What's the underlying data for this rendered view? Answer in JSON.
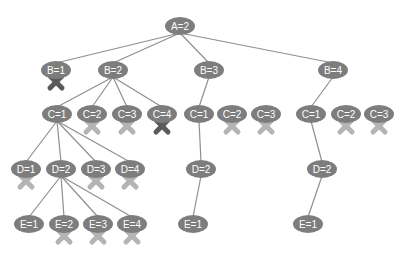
{
  "diagram": {
    "type": "search-tree",
    "colors": {
      "node_fill": "#7d7d7d",
      "edge": "#8f8f8f",
      "prune_dark": "#5a5a5a",
      "prune_light": "#b4b4b4",
      "background": "#ffffff"
    },
    "nodes": [
      {
        "id": "a2",
        "label": "A=2",
        "x": 180,
        "y": 26,
        "prune": null
      },
      {
        "id": "b1",
        "label": "B=1",
        "x": 56,
        "y": 70,
        "prune": "dark"
      },
      {
        "id": "b2",
        "label": "B=2",
        "x": 113,
        "y": 70,
        "prune": null
      },
      {
        "id": "b3",
        "label": "B=3",
        "x": 209,
        "y": 70,
        "prune": null
      },
      {
        "id": "b4",
        "label": "B=4",
        "x": 333,
        "y": 70,
        "prune": null
      },
      {
        "id": "b2c1",
        "label": "C=1",
        "x": 57,
        "y": 114,
        "prune": null
      },
      {
        "id": "b2c2",
        "label": "C=2",
        "x": 92,
        "y": 114,
        "prune": "light"
      },
      {
        "id": "b2c3",
        "label": "C=3",
        "x": 127,
        "y": 114,
        "prune": "light"
      },
      {
        "id": "b2c4",
        "label": "C=4",
        "x": 162,
        "y": 114,
        "prune": "dark"
      },
      {
        "id": "b3c1",
        "label": "C=1",
        "x": 199,
        "y": 114,
        "prune": null
      },
      {
        "id": "b3c2",
        "label": "C=2",
        "x": 232,
        "y": 114,
        "prune": "light"
      },
      {
        "id": "b3c3",
        "label": "C=3",
        "x": 266,
        "y": 114,
        "prune": "light"
      },
      {
        "id": "b4c1",
        "label": "C=1",
        "x": 311,
        "y": 114,
        "prune": null
      },
      {
        "id": "b4c2",
        "label": "C=2",
        "x": 346,
        "y": 114,
        "prune": "light"
      },
      {
        "id": "b4c3",
        "label": "C=3",
        "x": 379,
        "y": 114,
        "prune": "light"
      },
      {
        "id": "d1",
        "label": "D=1",
        "x": 26,
        "y": 169,
        "prune": "light"
      },
      {
        "id": "d2",
        "label": "D=2",
        "x": 61,
        "y": 169,
        "prune": null
      },
      {
        "id": "d3",
        "label": "D=3",
        "x": 96,
        "y": 169,
        "prune": "light"
      },
      {
        "id": "d4",
        "label": "D=4",
        "x": 130,
        "y": 169,
        "prune": "light"
      },
      {
        "id": "b3d2",
        "label": "D=2",
        "x": 201,
        "y": 169,
        "prune": null
      },
      {
        "id": "b4d2",
        "label": "D=2",
        "x": 322,
        "y": 169,
        "prune": null
      },
      {
        "id": "e1",
        "label": "E=1",
        "x": 29,
        "y": 224,
        "prune": null
      },
      {
        "id": "e2",
        "label": "E=2",
        "x": 64,
        "y": 224,
        "prune": "light"
      },
      {
        "id": "e3",
        "label": "E=3",
        "x": 98,
        "y": 224,
        "prune": "light"
      },
      {
        "id": "e4",
        "label": "E=4",
        "x": 132,
        "y": 224,
        "prune": "light"
      },
      {
        "id": "b3e1",
        "label": "E=1",
        "x": 193,
        "y": 224,
        "prune": null
      },
      {
        "id": "b4e1",
        "label": "E=1",
        "x": 308,
        "y": 224,
        "prune": null
      }
    ],
    "edges": [
      [
        "a2",
        "b1"
      ],
      [
        "a2",
        "b2"
      ],
      [
        "a2",
        "b3"
      ],
      [
        "a2",
        "b4"
      ],
      [
        "b2",
        "b2c1"
      ],
      [
        "b2",
        "b2c2"
      ],
      [
        "b2",
        "b2c3"
      ],
      [
        "b2",
        "b2c4"
      ],
      [
        "b3",
        "b3c1"
      ],
      [
        "b4",
        "b4c1"
      ],
      [
        "b2c1",
        "d1"
      ],
      [
        "b2c1",
        "d2"
      ],
      [
        "b2c1",
        "d3"
      ],
      [
        "b2c1",
        "d4"
      ],
      [
        "d2",
        "e1"
      ],
      [
        "d2",
        "e2"
      ],
      [
        "d2",
        "e3"
      ],
      [
        "d2",
        "e4"
      ],
      [
        "b3c1",
        "b3d2"
      ],
      [
        "b3d2",
        "b3e1"
      ],
      [
        "b4c1",
        "b4d2"
      ],
      [
        "b4d2",
        "b4e1"
      ]
    ]
  }
}
